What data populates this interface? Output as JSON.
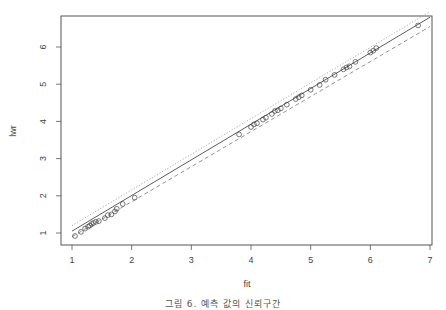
{
  "chart_data": {
    "type": "scatter",
    "title": "",
    "xlabel": "fit",
    "ylabel": "lwr",
    "xlim": [
      0.95,
      7.05
    ],
    "ylim": [
      0.68,
      6.9
    ],
    "x_ticks": [
      1,
      2,
      3,
      4,
      5,
      6,
      7
    ],
    "y_ticks": [
      1,
      2,
      3,
      4,
      5,
      6
    ],
    "grid": false,
    "legend": null,
    "points": {
      "name": "observed",
      "marker": "open-circle",
      "x": [
        1.05,
        1.15,
        1.22,
        1.27,
        1.3,
        1.33,
        1.36,
        1.4,
        1.45,
        1.55,
        1.6,
        1.66,
        1.72,
        1.75,
        1.85,
        2.05,
        3.8,
        4.0,
        4.05,
        4.1,
        4.2,
        4.25,
        4.35,
        4.4,
        4.45,
        4.5,
        4.6,
        4.75,
        4.8,
        4.85,
        5.0,
        5.15,
        5.25,
        5.4,
        5.55,
        5.6,
        5.65,
        5.75,
        6.0,
        6.05,
        6.1,
        6.8
      ],
      "y": [
        0.92,
        1.03,
        1.12,
        1.17,
        1.2,
        1.24,
        1.27,
        1.3,
        1.32,
        1.4,
        1.48,
        1.5,
        1.58,
        1.65,
        1.78,
        1.95,
        3.65,
        3.85,
        3.92,
        3.95,
        4.05,
        4.1,
        4.2,
        4.28,
        4.3,
        4.35,
        4.45,
        4.6,
        4.65,
        4.7,
        4.85,
        4.98,
        5.12,
        5.25,
        5.4,
        5.45,
        5.48,
        5.6,
        5.85,
        5.9,
        5.97,
        6.58
      ]
    },
    "lines": [
      {
        "name": "fit",
        "style": "solid",
        "color": "#333333",
        "x": [
          1.0,
          7.0
        ],
        "y": [
          1.05,
          6.8
        ]
      },
      {
        "name": "upper",
        "style": "dotted",
        "color": "#999999",
        "x": [
          1.0,
          7.0
        ],
        "y": [
          1.2,
          6.95
        ]
      },
      {
        "name": "lower",
        "style": "dashed",
        "color": "#777777",
        "x": [
          1.0,
          7.0
        ],
        "y": [
          0.9,
          6.55
        ]
      }
    ]
  },
  "caption": "그림 6. 예측 값의 신뢰구간"
}
